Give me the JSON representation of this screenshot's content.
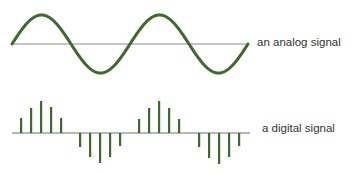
{
  "analog": {
    "label": "an analog signal",
    "baseline_y": 44,
    "x_start": 12,
    "x_end": 248,
    "amplitude": 29,
    "period": 118,
    "color": "#3d6b2a",
    "axis_color": "#8a8a8a"
  },
  "digital": {
    "label": "a digital signal",
    "baseline_y": 133,
    "x_start": 12,
    "x_end": 250,
    "color": "#3d6b2a",
    "axis_color": "#707070",
    "samples": [
      {
        "x": 21,
        "v": 15
      },
      {
        "x": 31,
        "v": 25
      },
      {
        "x": 41,
        "v": 32
      },
      {
        "x": 51,
        "v": 26
      },
      {
        "x": 61,
        "v": 15
      },
      {
        "x": 80,
        "v": -14
      },
      {
        "x": 90,
        "v": -24
      },
      {
        "x": 100,
        "v": -30
      },
      {
        "x": 110,
        "v": -24
      },
      {
        "x": 120,
        "v": -13
      },
      {
        "x": 139,
        "v": 14
      },
      {
        "x": 149,
        "v": 25
      },
      {
        "x": 159,
        "v": 32
      },
      {
        "x": 169,
        "v": 25
      },
      {
        "x": 179,
        "v": 14
      },
      {
        "x": 199,
        "v": -14
      },
      {
        "x": 209,
        "v": -25
      },
      {
        "x": 219,
        "v": -31
      },
      {
        "x": 229,
        "v": -24
      },
      {
        "x": 239,
        "v": -13
      }
    ]
  }
}
